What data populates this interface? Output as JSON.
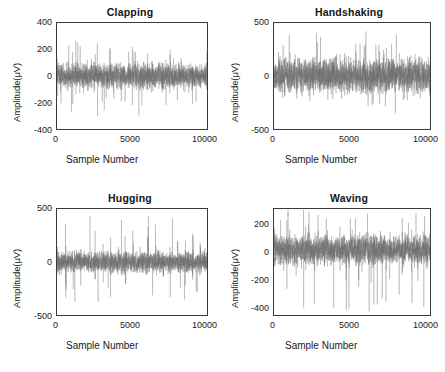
{
  "figure": {
    "layout": "2x2-grid",
    "background_color": "#ffffff",
    "axis_color": "#3a3a3a",
    "signal_color": "#6e6e6e",
    "text_color": "#1a1a1a"
  },
  "chart_data": [
    {
      "type": "line",
      "title": "Clapping",
      "xlabel": "Sample Number",
      "ylabel": "Amplitude(μV)",
      "xlim": [
        0,
        10000
      ],
      "ylim": [
        -400,
        400
      ],
      "xticks": [
        0,
        5000,
        10000
      ],
      "xticklabels": [
        "0",
        "5000",
        "10000"
      ],
      "yticks": [
        400,
        200,
        0,
        -200,
        -400
      ],
      "yticklabels": [
        "400",
        "200",
        "0",
        "-200",
        "-400"
      ],
      "grid": false,
      "legend": null,
      "series": [
        {
          "name": "EEG Clapping",
          "description": "Dense zero-mean noisy EEG burst train spanning 0-10000 samples",
          "baseline": 0,
          "rms_envelope": 70,
          "peak_positive": 280,
          "peak_negative": -310,
          "burst_rate_per_1000_samples": 4,
          "seed": 11
        }
      ]
    },
    {
      "type": "line",
      "title": "Handshaking",
      "xlabel": "Sample Number",
      "ylabel": "Amplitude(μV)",
      "xlim": [
        0,
        10000
      ],
      "ylim": [
        -500,
        500
      ],
      "xticks": [
        0,
        5000,
        10000
      ],
      "xticklabels": [
        "0",
        "5000",
        "10000"
      ],
      "yticks": [
        500,
        0,
        -500
      ],
      "yticklabels": [
        "500",
        "0",
        "-500"
      ],
      "grid": false,
      "legend": null,
      "series": [
        {
          "name": "EEG Handshaking",
          "description": "Broad high-density noise band with recurring bursts, larger amplitude than Clapping",
          "baseline": 0,
          "rms_envelope": 120,
          "peak_positive": 430,
          "peak_negative": -355,
          "burst_rate_per_1000_samples": 4,
          "seed": 23
        }
      ]
    },
    {
      "type": "line",
      "title": "Hugging",
      "xlabel": "Sample Number",
      "ylabel": "Amplitude(μV)",
      "xlim": [
        0,
        10000
      ],
      "ylim": [
        -500,
        500
      ],
      "xticks": [
        0,
        5000,
        10000
      ],
      "xticklabels": [
        "0",
        "5000",
        "10000"
      ],
      "yticks": [
        500,
        0,
        -500
      ],
      "yticklabels": [
        "500",
        "0",
        "-500"
      ],
      "grid": false,
      "legend": null,
      "series": [
        {
          "name": "EEG Hugging",
          "description": "Narrower noise band with isolated large transients near sample 2200 and 7700",
          "baseline": 0,
          "rms_envelope": 75,
          "peak_positive": 455,
          "peak_negative": -390,
          "transient_positions": [
            2200,
            7700
          ],
          "burst_rate_per_1000_samples": 2,
          "seed": 37
        }
      ]
    },
    {
      "type": "line",
      "title": "Waving",
      "xlabel": "Sample Number",
      "ylabel": "Amplitude(μV)",
      "xlim": [
        0,
        10000
      ],
      "ylim": [
        -480,
        300
      ],
      "xticks": [
        0,
        5000,
        10000
      ],
      "xticklabels": [
        "0",
        "5000",
        "10000"
      ],
      "yticks": [
        200,
        0,
        -200,
        -400
      ],
      "yticklabels": [
        "200",
        "0",
        "-200",
        "-400"
      ],
      "grid": false,
      "legend": null,
      "series": [
        {
          "name": "EEG Waving",
          "description": "Dense noise band skewed negative with full-height spikes near samples 900, 1900 and 6100",
          "baseline": 0,
          "rms_envelope": 80,
          "peak_positive": 295,
          "peak_negative": -470,
          "full_height_spikes": [
            900,
            1900,
            6100
          ],
          "burst_rate_per_1000_samples": 5,
          "seed": 53
        }
      ]
    }
  ]
}
